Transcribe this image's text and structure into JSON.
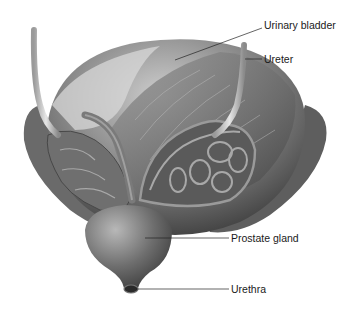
{
  "figure": {
    "labels": [
      {
        "id": "urinary-bladder",
        "text": "Urinary bladder",
        "x": 264,
        "y": 25,
        "anchor": [
          175,
          60
        ]
      },
      {
        "id": "ureter",
        "text": "Ureter",
        "x": 264,
        "y": 55,
        "anchor": [
          243,
          59
        ]
      },
      {
        "id": "prostate-gland",
        "text": "Prostate gland",
        "x": 231,
        "y": 233,
        "anchor": [
          145,
          238
        ]
      },
      {
        "id": "urethra",
        "text": "Urethra",
        "x": 231,
        "y": 284,
        "anchor": [
          135,
          288
        ]
      }
    ]
  },
  "colors": {
    "background": "#ffffff",
    "tissue_dark": "#4a4a4a",
    "tissue_mid": "#7a7a7a",
    "tissue_light": "#c8c8c8",
    "leader_line": "#222222",
    "label_text": "#1a1a1a"
  }
}
